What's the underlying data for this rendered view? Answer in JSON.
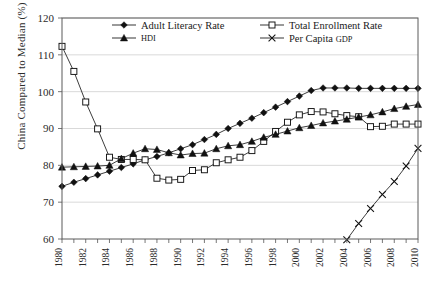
{
  "chart_data": {
    "type": "line",
    "title": "",
    "xlabel": "",
    "ylabel": "China Compared to Median (%)",
    "xlim": [
      1980,
      2010
    ],
    "ylim": [
      60,
      120
    ],
    "yticks": [
      60,
      70,
      80,
      90,
      100,
      110,
      120
    ],
    "xticks": [
      1980,
      1981,
      1982,
      1983,
      1984,
      1985,
      1986,
      1987,
      1988,
      1989,
      1990,
      1991,
      1992,
      1993,
      1994,
      1995,
      1996,
      1997,
      1998,
      1999,
      2000,
      2001,
      2002,
      2003,
      2004,
      2005,
      2006,
      2007,
      2008,
      2009,
      2010
    ],
    "xtick_labels": [
      "1980",
      "1982",
      "1984",
      "1986",
      "1988",
      "1990",
      "1992",
      "1994",
      "1996",
      "1998",
      "2000",
      "2002",
      "2004",
      "2006",
      "2008",
      "2010"
    ],
    "xtick_label_years": [
      1980,
      1982,
      1984,
      1986,
      1988,
      1990,
      1992,
      1994,
      1996,
      1998,
      2000,
      2002,
      2004,
      2006,
      2008,
      2010
    ],
    "grid": true,
    "grid_axis": "y",
    "legend_position": "top-inside",
    "x": [
      1980,
      1981,
      1982,
      1983,
      1984,
      1985,
      1986,
      1987,
      1988,
      1989,
      1990,
      1991,
      1992,
      1993,
      1994,
      1995,
      1996,
      1997,
      1998,
      1999,
      2000,
      2001,
      2002,
      2003,
      2004,
      2005,
      2006,
      2007,
      2008,
      2009,
      2010
    ],
    "series": [
      {
        "name": "Adult Literacy Rate",
        "marker": "filled-diamond",
        "x": [
          1980,
          1981,
          1982,
          1983,
          1984,
          1985,
          1986,
          1987,
          1988,
          1989,
          1990,
          1991,
          1992,
          1993,
          1994,
          1995,
          1996,
          1997,
          1998,
          1999,
          2000,
          2001,
          2002,
          2003,
          2004,
          2005,
          2006,
          2007,
          2008,
          2009,
          2010
        ],
        "values": [
          74.3,
          75.4,
          76.4,
          77.4,
          78.4,
          79.4,
          80.4,
          81.5,
          82.4,
          83.4,
          84.5,
          85.6,
          87.0,
          88.4,
          90.0,
          91.4,
          92.8,
          94.3,
          95.8,
          97.3,
          98.8,
          100.3,
          101.0,
          101.0,
          101.0,
          100.9,
          100.9,
          100.9,
          100.9,
          100.9,
          100.9
        ]
      },
      {
        "name": "Total Enrollment Rate",
        "marker": "open-square",
        "x": [
          1980,
          1981,
          1982,
          1983,
          1984,
          1985,
          1986,
          1987,
          1988,
          1989,
          1990,
          1991,
          1992,
          1993,
          1994,
          1995,
          1996,
          1997,
          1998,
          1999,
          2000,
          2001,
          2002,
          2003,
          2004,
          2005,
          2006,
          2007,
          2008,
          2009,
          2010
        ],
        "values": [
          112.3,
          105.5,
          97.2,
          89.9,
          82.2,
          81.6,
          81.6,
          81.5,
          76.5,
          76.0,
          76.2,
          78.6,
          78.8,
          80.7,
          81.5,
          82.2,
          84.0,
          86.5,
          89.2,
          91.7,
          93.7,
          94.6,
          94.5,
          94.0,
          93.5,
          93.2,
          90.5,
          90.6,
          91.2,
          91.2,
          91.2
        ]
      },
      {
        "name": "HDI",
        "marker": "filled-triangle",
        "x": [
          1980,
          1981,
          1982,
          1983,
          1984,
          1985,
          1986,
          1987,
          1988,
          1989,
          1990,
          1991,
          1992,
          1993,
          1994,
          1995,
          1996,
          1997,
          1998,
          1999,
          2000,
          2001,
          2002,
          2003,
          2004,
          2005,
          2006,
          2007,
          2008,
          2009,
          2010
        ],
        "values": [
          79.5,
          79.6,
          79.7,
          79.8,
          80.0,
          81.8,
          83.3,
          84.5,
          84.3,
          83.4,
          82.8,
          83.2,
          83.3,
          84.5,
          85.3,
          85.6,
          86.5,
          87.6,
          88.4,
          89.3,
          90.2,
          90.8,
          91.5,
          92.0,
          92.5,
          93.1,
          93.7,
          94.5,
          95.4,
          96.0,
          96.5
        ]
      },
      {
        "name": "Per Capita GDP",
        "marker": "cross-x",
        "x": [
          2004,
          2005,
          2006,
          2007,
          2008,
          2009,
          2010
        ],
        "values": [
          59.8,
          64.2,
          68.3,
          72.1,
          75.6,
          79.8,
          84.6
        ]
      }
    ],
    "legend": [
      {
        "label": "Adult Literacy Rate",
        "marker": "filled-diamond"
      },
      {
        "label": "Total Enrollment Rate",
        "marker": "open-square"
      },
      {
        "label": "HDI",
        "marker": "filled-triangle",
        "smallcaps": true
      },
      {
        "label": "Per Capita GDP",
        "marker": "cross-x",
        "smallcaps_tail": "GDP",
        "head": "Per Capita "
      }
    ]
  },
  "colors": {
    "ink": "#1a1a1a",
    "grid": "#c9c9c9",
    "frame": "#5a5a5a",
    "background": "#ffffff"
  }
}
